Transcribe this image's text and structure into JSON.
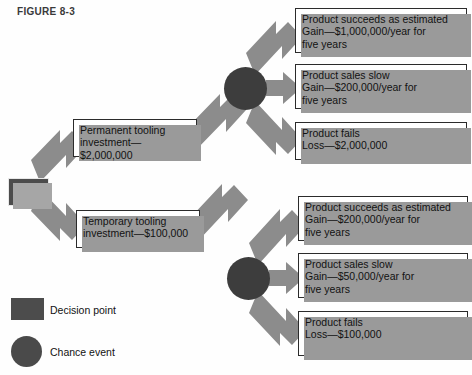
{
  "figure": {
    "label": "FIGURE 8-3",
    "colors": {
      "arrow_fill": "#8c8c8c",
      "node_dark": "#4c4c4c",
      "circle_dark": "#3d3d3d",
      "box_border": "#2b2b2b",
      "box_fill": "#ffffff",
      "shadow": "#9a9a9a",
      "text": "#121212",
      "label_text": "#3a3a3a"
    }
  },
  "nodes": {
    "decision_point": {
      "name": "decision-point-square",
      "shape": "square"
    },
    "chance_upper": {
      "name": "chance-event-upper",
      "shape": "circle"
    },
    "chance_lower": {
      "name": "chance-event-lower",
      "shape": "circle"
    }
  },
  "decisions": [
    {
      "id": "permanent",
      "label": "Permanent tooling\ninvestment—$2,000,000",
      "investment": 2000000,
      "investment_label": "$2,000,000",
      "outcomes": [
        {
          "id": "perm-succeeds",
          "label": "Product succeeds as estimated\nGain—$1,000,000/year for\nfive years",
          "outcome": "Product succeeds as estimated",
          "result_type": "Gain",
          "amount_label": "$1,000,000/year for five years",
          "amount": 1000000,
          "years": 5
        },
        {
          "id": "perm-slow",
          "label": "Product sales slow\nGain—$200,000/year for\nfive years",
          "outcome": "Product sales slow",
          "result_type": "Gain",
          "amount_label": "$200,000/year for five years",
          "amount": 200000,
          "years": 5
        },
        {
          "id": "perm-fails",
          "label": "Product fails\nLoss—$2,000,000",
          "outcome": "Product fails",
          "result_type": "Loss",
          "amount_label": "$2,000,000",
          "amount": 2000000,
          "years": null
        }
      ]
    },
    {
      "id": "temporary",
      "label": "Temporary tooling\ninvestment—$100,000",
      "investment": 100000,
      "investment_label": "$100,000",
      "outcomes": [
        {
          "id": "temp-succeeds",
          "label": "Product succeeds as estimated\nGain—$200,000/year for\nfive years",
          "outcome": "Product succeeds as estimated",
          "result_type": "Gain",
          "amount_label": "$200,000/year for five years",
          "amount": 200000,
          "years": 5
        },
        {
          "id": "temp-slow",
          "label": "Product sales slow\nGain—$50,000/year for\nfive years",
          "outcome": "Product sales slow",
          "result_type": "Gain",
          "amount_label": "$50,000/year for five years",
          "amount": 50000,
          "years": 5
        },
        {
          "id": "temp-fails",
          "label": "Product fails\nLoss—$100,000",
          "outcome": "Product fails",
          "result_type": "Loss",
          "amount_label": "$100,000",
          "amount": 100000,
          "years": null
        }
      ]
    }
  ],
  "legend": [
    {
      "symbol": "square",
      "label": "Decision point"
    },
    {
      "symbol": "circle",
      "label": "Chance event"
    }
  ]
}
